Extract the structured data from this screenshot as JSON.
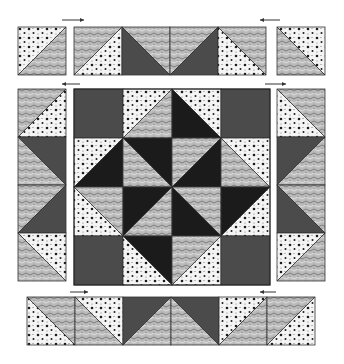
{
  "diagram": {
    "type": "quilt-block-assembly",
    "fabrics": {
      "dots": {
        "name": "white with black dots",
        "bg": "#f4f4f4",
        "dot": "#1c1c1c"
      },
      "swirl": {
        "name": "grey swirl print",
        "bg": "#b9b9b9",
        "line": "#6a6a6a"
      },
      "dark": {
        "name": "dark grey solid",
        "color": "#4b4b4b"
      },
      "black": {
        "name": "black solid",
        "color": "#1b1b1b"
      }
    },
    "cell_size": 48,
    "units": [
      {
        "id": "top-left-square",
        "x": 18,
        "y": 27,
        "cells": [
          {
            "diag": "bltr",
            "a": "dots",
            "b": "swirl"
          }
        ],
        "dir": "row"
      },
      {
        "id": "top-strip",
        "x": 74,
        "y": 27,
        "dir": "row",
        "cells": [
          {
            "diag": "bltr",
            "a": "swirl",
            "b": "dots"
          },
          {
            "diag": "tlbr",
            "a": "swirl",
            "b": "dark"
          },
          {
            "diag": "bltr",
            "a": "swirl",
            "b": "dark"
          },
          {
            "diag": "tlbr",
            "a": "swirl",
            "b": "dots"
          }
        ]
      },
      {
        "id": "top-right-square",
        "x": 277,
        "y": 27,
        "dir": "row",
        "cells": [
          {
            "diag": "tlbr",
            "a": "dots",
            "b": "swirl"
          }
        ]
      },
      {
        "id": "left-column",
        "x": 18,
        "y": 89,
        "dir": "col",
        "cells": [
          {
            "diag": "bltr",
            "a": "swirl",
            "b": "dots"
          },
          {
            "diag": "tlbr",
            "a": "dark",
            "b": "swirl"
          },
          {
            "diag": "bltr",
            "a": "swirl",
            "b": "dark"
          },
          {
            "diag": "tlbr",
            "a": "dots",
            "b": "swirl"
          }
        ]
      },
      {
        "id": "right-column",
        "x": 277,
        "y": 89,
        "dir": "col",
        "cells": [
          {
            "diag": "tlbr",
            "a": "swirl",
            "b": "dots"
          },
          {
            "diag": "bltr",
            "a": "dark",
            "b": "swirl"
          },
          {
            "diag": "tlbr",
            "a": "swirl",
            "b": "dark"
          },
          {
            "diag": "bltr",
            "a": "dots",
            "b": "swirl"
          }
        ]
      },
      {
        "id": "bottom-strip",
        "x": 27,
        "y": 297,
        "dir": "row",
        "cells": [
          {
            "diag": "tlbr",
            "a": "swirl",
            "b": "dots"
          },
          {
            "diag": "tlbr",
            "a": "dots",
            "b": "swirl"
          },
          {
            "diag": "bltr",
            "a": "dark",
            "b": "swirl"
          },
          {
            "diag": "tlbr",
            "a": "dark",
            "b": "swirl"
          },
          {
            "diag": "bltr",
            "a": "dots",
            "b": "swirl"
          },
          {
            "diag": "bltr",
            "a": "swirl",
            "b": "dots"
          }
        ]
      }
    ],
    "center_block": {
      "x": 74,
      "y": 89,
      "size": 49,
      "rows": [
        [
          {
            "solid": "dark"
          },
          {
            "diag": "bltr",
            "a": "dots",
            "b": "swirl"
          },
          {
            "diag": "tlbr",
            "a": "dots",
            "b": "black"
          },
          {
            "solid": "dark"
          }
        ],
        [
          {
            "diag": "bltr",
            "a": "dots",
            "b": "black"
          },
          {
            "diag": "tlbr",
            "a": "black",
            "b": "swirl"
          },
          {
            "diag": "bltr",
            "a": "swirl",
            "b": "black"
          },
          {
            "diag": "tlbr",
            "a": "dots",
            "b": "swirl"
          }
        ],
        [
          {
            "diag": "tlbr",
            "a": "swirl",
            "b": "dots"
          },
          {
            "diag": "bltr",
            "a": "black",
            "b": "swirl"
          },
          {
            "diag": "tlbr",
            "a": "swirl",
            "b": "black"
          },
          {
            "diag": "bltr",
            "a": "black",
            "b": "dots"
          }
        ],
        [
          {
            "solid": "dark"
          },
          {
            "diag": "tlbr",
            "a": "black",
            "b": "dots"
          },
          {
            "diag": "bltr",
            "a": "swirl",
            "b": "dots"
          },
          {
            "solid": "dark"
          }
        ]
      ]
    },
    "pressing_arrows": [
      {
        "id": "arrow-top-left-row",
        "x1": 62,
        "y1": 20,
        "x2": 84,
        "y2": 20,
        "direction": "right"
      },
      {
        "id": "arrow-top-right-row",
        "x1": 280,
        "y1": 20,
        "x2": 260,
        "y2": 20,
        "direction": "left"
      },
      {
        "id": "arrow-left-column",
        "x1": 80,
        "y1": 84,
        "x2": 62,
        "y2": 84,
        "direction": "left"
      },
      {
        "id": "arrow-right-column",
        "x1": 265,
        "y1": 84,
        "x2": 286,
        "y2": 84,
        "direction": "right"
      },
      {
        "id": "arrow-bottom-left",
        "x1": 70,
        "y1": 292,
        "x2": 88,
        "y2": 292,
        "direction": "right"
      },
      {
        "id": "arrow-bottom-right",
        "x1": 276,
        "y1": 292,
        "x2": 260,
        "y2": 292,
        "direction": "left"
      }
    ]
  }
}
